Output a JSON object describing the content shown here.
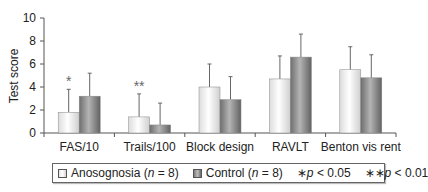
{
  "chart_data": {
    "type": "bar",
    "title": "",
    "xlabel": "",
    "ylabel": "Test score",
    "ylim": [
      0,
      10
    ],
    "yticks": [
      0,
      2,
      4,
      6,
      8,
      10
    ],
    "grid": false,
    "legend_position": "bottom",
    "categories": [
      "FAS/10",
      "Trails/100",
      "Block design",
      "RAVLT",
      "Benton vis rent"
    ],
    "series": [
      {
        "name": "Anosognosia (n = 8)",
        "values": [
          1.8,
          1.4,
          4.0,
          4.7,
          5.5
        ],
        "error": [
          2.0,
          2.0,
          2.0,
          2.0,
          2.0
        ],
        "color": "#e8e8e8"
      },
      {
        "name": "Control (n = 8)",
        "values": [
          3.2,
          0.7,
          2.9,
          6.6,
          4.8
        ],
        "error": [
          2.0,
          1.9,
          2.0,
          2.0,
          2.0
        ],
        "color": "#8c8c8c"
      }
    ],
    "annotations": [
      {
        "category": "FAS/10",
        "series": "Anosognosia (n = 8)",
        "text": "*"
      },
      {
        "category": "Trails/100",
        "series": "Anosognosia (n = 8)",
        "text": "**"
      }
    ]
  },
  "legend": {
    "anosognosia_label": "Anosognosia",
    "anosognosia_n": "(n = 8)",
    "control_label": "Control",
    "control_n": "(n = 8)",
    "sig1": "*p < 0.05",
    "sig2": "**p < 0.01"
  }
}
